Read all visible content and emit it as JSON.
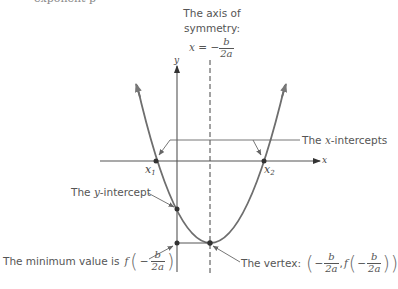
{
  "clipped_top_text": "exponent p",
  "axis_of_symmetry": {
    "line1": "The axis of",
    "line2": "symmetry:",
    "equation_lhs": "x",
    "equals": "=",
    "minus": "−",
    "numerator": "b",
    "denominator": "2a"
  },
  "axes": {
    "x_label": "x",
    "y_label": "y"
  },
  "points": {
    "x1_label": "x",
    "x1_sub": "1",
    "x2_label": "x",
    "x2_sub": "2"
  },
  "annotations": {
    "x_intercepts": {
      "prefix": "The ",
      "var": "x",
      "suffix": "-intercepts"
    },
    "y_intercept": {
      "prefix": "The ",
      "var": "y",
      "suffix": "-intercept"
    },
    "minimum_value": {
      "text": "The minimum value is",
      "func": "f",
      "minus": "−",
      "numerator": "b",
      "denominator": "2a"
    },
    "vertex": {
      "text": "The vertex:",
      "minus1": "−",
      "numerator1": "b",
      "denominator1": "2a",
      "comma": ",",
      "func": "f",
      "minus2": "−",
      "numerator2": "b",
      "denominator2": "2a"
    }
  },
  "colors": {
    "curve": "#6e6e6e",
    "axis": "#555555",
    "text": "#555555",
    "point": "#333333"
  }
}
